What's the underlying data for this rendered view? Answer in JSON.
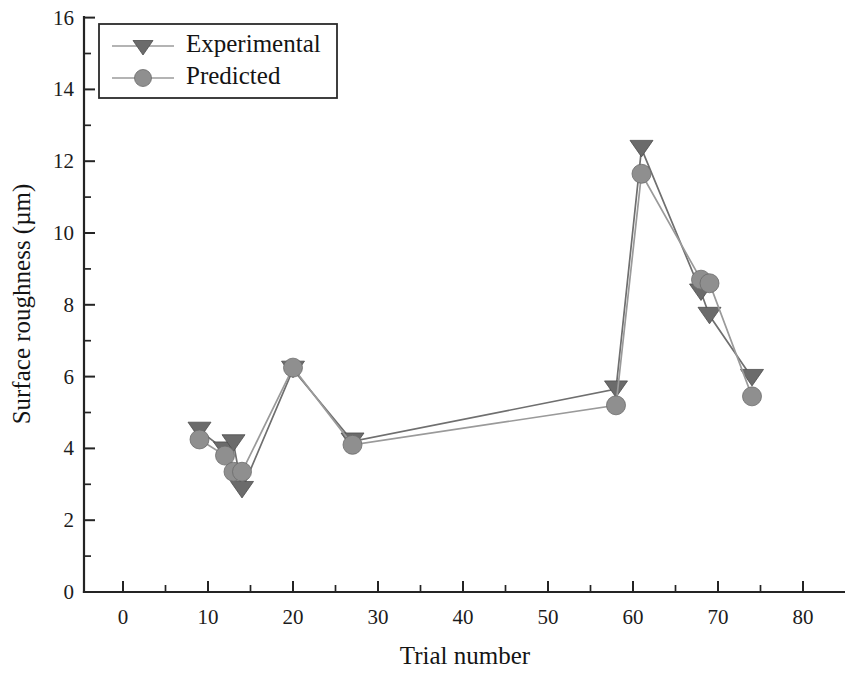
{
  "chart_data": {
    "type": "line",
    "title": "",
    "xlabel": "Trial number",
    "ylabel": "Surface roughness (µm)",
    "xlim": [
      -5,
      85
    ],
    "ylim": [
      0,
      16
    ],
    "xticks": [
      0,
      10,
      20,
      30,
      40,
      50,
      60,
      70,
      80
    ],
    "yticks": [
      0,
      2,
      4,
      6,
      8,
      10,
      12,
      14,
      16
    ],
    "xtick_labels": [
      "0",
      "10",
      "20",
      "30",
      "40",
      "50",
      "60",
      "70",
      "80"
    ],
    "ytick_labels": [
      "0",
      "2",
      "4",
      "6",
      "8",
      "10",
      "12",
      "14",
      "16"
    ],
    "minor_ticks": true,
    "grid": false,
    "legend_position": "upper left",
    "x": [
      9,
      12,
      13,
      14,
      20,
      27,
      58,
      61,
      68,
      69,
      74
    ],
    "series": [
      {
        "name": "Experimental",
        "marker": "triangle-down",
        "color": "#6b6b6b",
        "values": [
          4.5,
          3.95,
          4.15,
          2.85,
          6.2,
          4.2,
          5.65,
          12.35,
          8.35,
          7.7,
          5.97
        ]
      },
      {
        "name": "Predicted",
        "marker": "circle",
        "color": "#8f8f8f",
        "values": [
          4.25,
          3.8,
          3.35,
          3.35,
          6.25,
          4.1,
          5.2,
          11.65,
          8.7,
          8.6,
          5.45
        ]
      }
    ]
  },
  "legend": {
    "entries": [
      {
        "label": "Experimental"
      },
      {
        "label": "Predicted"
      }
    ]
  },
  "colors": {
    "axis": "#242424",
    "experimental": "#6b6b6b",
    "predicted": "#8f8f8f",
    "background": "#ffffff"
  }
}
